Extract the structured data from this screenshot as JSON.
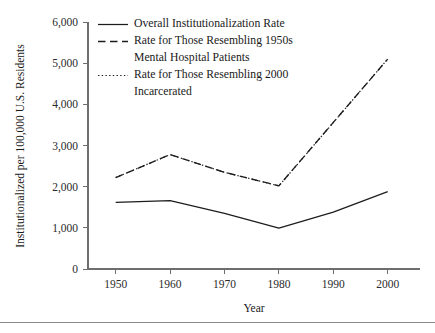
{
  "chart_data": {
    "type": "line",
    "title": "",
    "xlabel": "Year",
    "ylabel": "Institutionalized per 100,000 U.S. Residents",
    "x": [
      1950,
      1960,
      1970,
      1980,
      1990,
      2000
    ],
    "xtick_labels": [
      "1950",
      "1960",
      "1970",
      "1980",
      "1990",
      "2000"
    ],
    "ytick_labels": [
      "0",
      "1,000",
      "2,000",
      "3,000",
      "4,000",
      "5,000",
      "6,000"
    ],
    "ytick_values": [
      0,
      1000,
      2000,
      3000,
      4000,
      5000,
      6000
    ],
    "xlim": [
      1945,
      2005
    ],
    "ylim": [
      0,
      6000
    ],
    "grid": false,
    "legend_position": "top-left-inside",
    "series": [
      {
        "name": "Overall Institutionalization Rate",
        "style": "solid",
        "values": [
          1420,
          1590,
          1370,
          1080,
          1620,
          2280
        ]
      },
      {
        "name": "Rate for Those Resembling 1950s Mental Hospital Patients",
        "style": "dashed",
        "values": [
          1620,
          1660,
          1350,
          990,
          1380,
          1880
        ]
      },
      {
        "name": "Rate for Those Resembling 2000 Incarcerated",
        "style": "dotted",
        "values": [
          2220,
          2780,
          2350,
          2020,
          3560,
          5100
        ]
      }
    ]
  },
  "legend": {
    "entries": [
      {
        "label": "Overall Institutionalization Rate",
        "style": "solid"
      },
      {
        "label": "Rate for Those Resembling 1950s",
        "label_line2": "Mental Hospital Patients",
        "style": "dashed"
      },
      {
        "label": "Rate for Those Resembling 2000",
        "label_line2": "Incarcerated",
        "style": "dotted"
      }
    ]
  },
  "colors": {
    "ink": "#1d1d1d",
    "axis": "#6e6e6e",
    "background": "#ffffff"
  }
}
